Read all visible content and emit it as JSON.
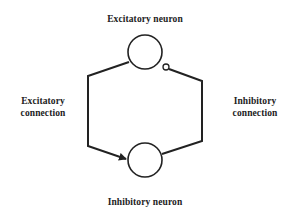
{
  "diagram": {
    "nodes": [
      {
        "id": "excitatory",
        "label": "Excitatory neuron"
      },
      {
        "id": "inhibitory",
        "label": "Inhibitory neuron"
      }
    ],
    "edges": [
      {
        "from": "excitatory",
        "to": "inhibitory",
        "type": "excitatory",
        "label_line1": "Excitatory",
        "label_line2": "connection",
        "terminal": "arrow"
      },
      {
        "from": "inhibitory",
        "to": "excitatory",
        "type": "inhibitory",
        "label_line1": "Inhibitory",
        "label_line2": "connection",
        "terminal": "small-circle"
      }
    ],
    "colors": {
      "line": "#222222",
      "background": "#ffffff"
    }
  }
}
